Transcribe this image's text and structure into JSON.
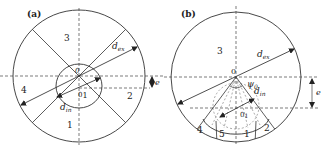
{
  "panels": [
    {
      "id": "a",
      "label": "(a)",
      "regions": [
        "1",
        "2",
        "3",
        "4"
      ],
      "labels": {
        "d_ex": "d",
        "d_ex_sub": "ex",
        "d_in": "d",
        "d_in_sub": "in",
        "center_O": "0",
        "center_O1": "0",
        "center_O1_sub": "1",
        "eccentricity": "e"
      }
    },
    {
      "id": "b",
      "label": "(b)",
      "regions": [
        "1",
        "2",
        "3",
        "4",
        "5"
      ],
      "labels": {
        "d_ex": "d",
        "d_ex_sub": "ex",
        "d_in": "d",
        "d_in_sub": "in",
        "center_O": "0",
        "center_O1": "0",
        "center_O1_sub": "1",
        "angle": "ψ",
        "angle_sub": "0",
        "eccentricity": "e"
      }
    }
  ],
  "colors": {
    "line": "#333333",
    "background": "#ffffff"
  }
}
